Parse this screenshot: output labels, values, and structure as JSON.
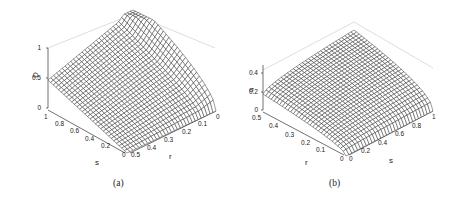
{
  "figures": [
    {
      "id": "a",
      "caption": "(a)",
      "zlabel": "D",
      "xlabel": "r",
      "ylabel": "s",
      "zticks": [
        "0",
        "0.5",
        "1"
      ],
      "rticks": [
        "0",
        "0.1",
        "0.2",
        "0.3",
        "0.4",
        "0.5"
      ],
      "sticks": [
        "0",
        "0.2",
        "0.4",
        "0.6",
        "0.8",
        "1"
      ]
    },
    {
      "id": "b",
      "caption": "(b)",
      "zlabel": "σ",
      "xlabel": "s",
      "ylabel": "r",
      "zticks": [
        "0",
        "0.2",
        "0.4"
      ],
      "rticks": [
        "0",
        "0.1",
        "0.2",
        "0.3",
        "0.4",
        "0.5"
      ],
      "sticks": [
        "0",
        "0.2",
        "0.4",
        "0.6",
        "0.8",
        "1"
      ]
    }
  ],
  "chart_data": [
    {
      "type": "surface",
      "title": "",
      "panel": "(a)",
      "xlabel": "r",
      "ylabel": "s",
      "zlabel": "D",
      "xlim": [
        0,
        0.5
      ],
      "ylim": [
        0,
        1
      ],
      "zlim": [
        0,
        1
      ],
      "x_ticks": [
        0,
        0.1,
        0.2,
        0.3,
        0.4,
        0.5
      ],
      "y_ticks": [
        0,
        0.2,
        0.4,
        0.6,
        0.8,
        1
      ],
      "z_ticks": [
        0,
        0.5,
        1
      ],
      "description": "Mesh surface; D ≈ 0.5 at r=0.5 for all s edge near s=1, rising to 1 at r=0,s=1 corner, D≈0 at r=0.5,s=0 corner with curved edge along r=0",
      "sample_points": [
        {
          "r": 0.5,
          "s": 1,
          "D": 0.5
        },
        {
          "r": 0,
          "s": 1,
          "D": 1.0
        },
        {
          "r": 0.5,
          "s": 0,
          "D": 0.0
        },
        {
          "r": 0,
          "s": 0,
          "D": 0.5
        }
      ]
    },
    {
      "type": "surface",
      "title": "",
      "panel": "(b)",
      "xlabel": "s",
      "ylabel": "r",
      "zlabel": "σ",
      "xlim": [
        0,
        1
      ],
      "ylim": [
        0,
        0.5
      ],
      "zlim": [
        0,
        0.45
      ],
      "x_ticks": [
        0,
        0.2,
        0.4,
        0.6,
        0.8,
        1
      ],
      "y_ticks": [
        0,
        0.1,
        0.2,
        0.3,
        0.4,
        0.5
      ],
      "z_ticks": [
        0,
        0.2,
        0.4
      ],
      "description": "Mesh surface; σ increases with r and s, concave, max ≈0.45 at r=0.5,s=1, ≈0.2 at r=0.5,s=0, ≈0 near r=0",
      "sample_points": [
        {
          "r": 0.5,
          "s": 0,
          "sigma": 0.18
        },
        {
          "r": 0.5,
          "s": 1,
          "sigma": 0.45
        },
        {
          "r": 0,
          "s": 1,
          "sigma": 0.15
        },
        {
          "r": 0,
          "s": 0,
          "sigma": 0.0
        }
      ]
    }
  ]
}
